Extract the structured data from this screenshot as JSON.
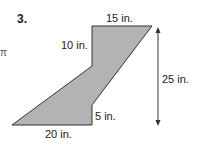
{
  "problem": {
    "number": "3.",
    "edge_mark": "π"
  },
  "figure": {
    "fill_color": "#b3b3b3",
    "stroke_color": "#333333",
    "labels": {
      "top": "15 in.",
      "left_upper": "10 in.",
      "height": "25 in.",
      "right_lower": "5 in.",
      "bottom": "20 in."
    }
  }
}
